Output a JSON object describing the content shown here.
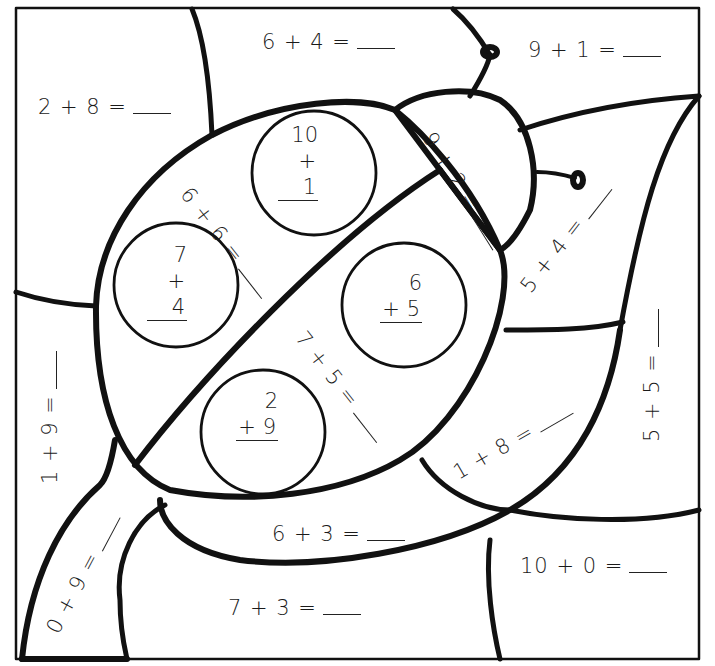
{
  "worksheet": {
    "title": "Ladybug color-by-number addition worksheet",
    "colors": {
      "line": "#111111",
      "background": "#ffffff"
    },
    "horizontal_equations": [
      {
        "id": "eq-2-8",
        "text": "2 + 8 ="
      },
      {
        "id": "eq-6-4",
        "text": "6 + 4 ="
      },
      {
        "id": "eq-9-1",
        "text": "9 + 1 ="
      },
      {
        "id": "eq-6-3",
        "text": "6 + 3 ="
      },
      {
        "id": "eq-10-0",
        "text": "10 + 0  ="
      },
      {
        "id": "eq-7-3",
        "text": "7 + 3 ="
      }
    ],
    "rotated_equations": [
      {
        "id": "eq-6-6",
        "text": "6 + 6 ="
      },
      {
        "id": "eq-9-2",
        "text": "9 + 2 ="
      },
      {
        "id": "eq-5-4",
        "text": "5 + 4 ="
      },
      {
        "id": "eq-7-5",
        "text": "7 + 5 ="
      },
      {
        "id": "eq-1-9",
        "text": "1 + 9 ="
      },
      {
        "id": "eq-5-5",
        "text": "5 + 5 ="
      },
      {
        "id": "eq-1-8",
        "text": "1 + 8 ="
      },
      {
        "id": "eq-0-9",
        "text": "0 + 9 ="
      }
    ],
    "spot_problems": [
      {
        "id": "spot-10-1",
        "top": "10",
        "bottom": "+ 1"
      },
      {
        "id": "spot-7-4",
        "top": "7",
        "bottom": "+ 4"
      },
      {
        "id": "spot-6-5",
        "top": "6",
        "bottom": "+ 5"
      },
      {
        "id": "spot-2-9",
        "top": "2",
        "bottom": "+ 9"
      }
    ]
  }
}
